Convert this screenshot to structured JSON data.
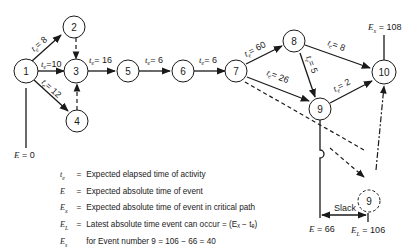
{
  "diagram": {
    "type": "PERT network",
    "nodes": [
      {
        "id": "1",
        "label": "1"
      },
      {
        "id": "2",
        "label": "2"
      },
      {
        "id": "3",
        "label": "3"
      },
      {
        "id": "4",
        "label": "4"
      },
      {
        "id": "5",
        "label": "5"
      },
      {
        "id": "6",
        "label": "6"
      },
      {
        "id": "7",
        "label": "7"
      },
      {
        "id": "8",
        "label": "8"
      },
      {
        "id": "9",
        "label": "9"
      },
      {
        "id": "10",
        "label": "10"
      },
      {
        "id": "9L",
        "label": "9",
        "style": "dashed"
      }
    ],
    "edges": [
      {
        "from": "1",
        "to": "2",
        "label_sym": "t",
        "label_sub": "e",
        "label_val": "= 8"
      },
      {
        "from": "1",
        "to": "3",
        "label_sym": "t",
        "label_sub": "e",
        "label_val": "=10"
      },
      {
        "from": "1",
        "to": "4",
        "label_sym": "t",
        "label_sub": "e",
        "label_val": "= 12"
      },
      {
        "from": "2",
        "to": "3",
        "style": "dashed"
      },
      {
        "from": "4",
        "to": "3",
        "style": "dashed"
      },
      {
        "from": "3",
        "to": "5",
        "label_sym": "t",
        "label_sub": "e",
        "label_val": "= 16"
      },
      {
        "from": "5",
        "to": "6",
        "label_sym": "t",
        "label_sub": "e",
        "label_val": "= 6"
      },
      {
        "from": "6",
        "to": "7",
        "label_sym": "t",
        "label_sub": "e",
        "label_val": "= 6"
      },
      {
        "from": "7",
        "to": "8",
        "label_sym": "t",
        "label_sub": "e",
        "label_val": "= 60"
      },
      {
        "from": "7",
        "to": "9",
        "label_sym": "t",
        "label_sub": "e",
        "label_val": "= 26"
      },
      {
        "from": "8",
        "to": "10",
        "label_sym": "t",
        "label_sub": "e",
        "label_val": "= 8"
      },
      {
        "from": "8",
        "to": "9",
        "label_sym": "t",
        "label_sub": "e",
        "label_val": "= 5"
      },
      {
        "from": "9",
        "to": "10",
        "label_sym": "t",
        "label_sub": "e",
        "label_val": "= 2"
      },
      {
        "from": "7",
        "to": "9L",
        "style": "dashed"
      },
      {
        "from": "9L",
        "to": "10",
        "style": "dashed"
      }
    ]
  },
  "annotations": {
    "start": {
      "sym": "E",
      "val": "= 0"
    },
    "end": {
      "sym": "E",
      "sub": "x",
      "val": "= 108"
    },
    "event9": {
      "sym": "E",
      "val": "= 66"
    },
    "latest9": {
      "sym": "E",
      "sub": "L",
      "val": "= 106"
    },
    "slack": "Slack"
  },
  "legend": [
    {
      "sym": "t",
      "sub": "e",
      "eq": "=",
      "text": "Expected elapsed time of activity"
    },
    {
      "sym": "E",
      "sub": "",
      "eq": "=",
      "text": "Expected absolute time of event"
    },
    {
      "sym": "E",
      "sub": "x",
      "eq": "=",
      "text": "Expected absolute time of event in critical path"
    },
    {
      "sym": "E",
      "sub": "L",
      "eq": "=",
      "text": "Latest absolute time event can occur = (Eₓ − tₑ)"
    },
    {
      "sym": "E",
      "sub": "s",
      "eq": "",
      "text": "for Event number   9 = 106 − 66 = 40"
    }
  ]
}
